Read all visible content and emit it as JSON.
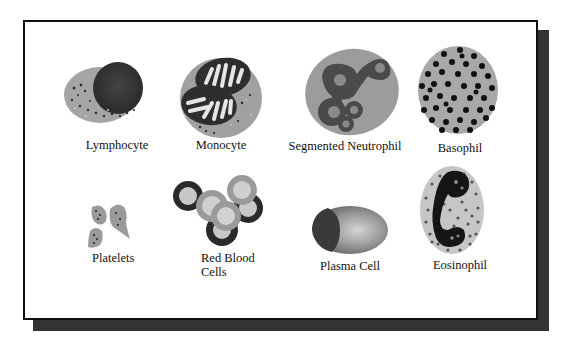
{
  "diagram": {
    "title": "",
    "colors": {
      "frame_border": "#111111",
      "shadow": "#333333",
      "cytoplasm_gray": "#a8a8a8",
      "nucleus_dark": "#3a3a3a",
      "granule": "#222222",
      "light_fill": "#d8d8d8"
    },
    "cells": [
      {
        "id": "lymphocyte",
        "label": "Lymphocyte"
      },
      {
        "id": "monocyte",
        "label": "Monocyte"
      },
      {
        "id": "segmented-neutrophil",
        "label": "Segmented Neutrophil"
      },
      {
        "id": "basophil",
        "label": "Basophil"
      },
      {
        "id": "platelets",
        "label": "Platelets"
      },
      {
        "id": "red-blood-cells",
        "label_line1": "Red Blood",
        "label_line2": "Cells"
      },
      {
        "id": "plasma-cell",
        "label": "Plasma Cell"
      },
      {
        "id": "eosinophil",
        "label": "Eosinophil"
      }
    ]
  }
}
